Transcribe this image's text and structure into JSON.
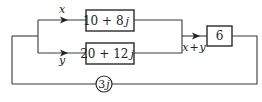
{
  "diagram": {
    "blocks": [
      {
        "id": "block-top",
        "label": "10 + 8",
        "suffix": "j"
      },
      {
        "id": "block-bottom",
        "label": "20 + 12",
        "suffix": "j"
      },
      {
        "id": "block-gain",
        "label": "6"
      }
    ],
    "feedback": {
      "label": "3",
      "suffix": "j"
    },
    "signals": {
      "top": "x",
      "bottom": "y",
      "sum_x": "x",
      "sum_plus": "+",
      "sum_y": "y"
    },
    "colors": {
      "stroke": "#2a2a2a",
      "background": "#ffffff"
    }
  }
}
